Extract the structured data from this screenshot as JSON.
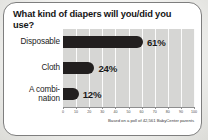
{
  "card": {
    "title": "What kind of diapers will you/did you use?",
    "source_note": "Based on a poll of 42,561 BabyCenter parents"
  },
  "colors": {
    "card_background": "#ffffff",
    "card_border": "#7e7e7e",
    "plot_background": "#d6d6d4",
    "gridline": "#fbfbfb",
    "bar": "#221f1f",
    "text": "#1a1a1a",
    "axis": "#8e8e8e"
  },
  "chart_data": {
    "type": "bar",
    "orientation": "horizontal",
    "title": "What kind of diapers will you/did you use?",
    "xlabel": "",
    "ylabel": "",
    "categories": [
      "Disposable",
      "Cloth",
      "A combi-nation"
    ],
    "category_labels": [
      [
        "Disposable"
      ],
      [
        "Cloth"
      ],
      [
        "A combi-",
        "nation"
      ]
    ],
    "values": [
      61,
      24,
      12
    ],
    "value_labels": [
      "61%",
      "24%",
      "12%"
    ],
    "xlim": [
      0,
      100
    ],
    "xticks": [
      0,
      10,
      20,
      30,
      40,
      50,
      60,
      70,
      80,
      90,
      100
    ],
    "xtick_labels": [
      "0",
      "10",
      "20",
      "30",
      "40",
      "50",
      "60",
      "70",
      "80",
      "90",
      "100"
    ],
    "grid": true,
    "grid_axis": "x",
    "legend": false,
    "annotation": "Based on a poll of 42,561 BabyCenter parents"
  }
}
